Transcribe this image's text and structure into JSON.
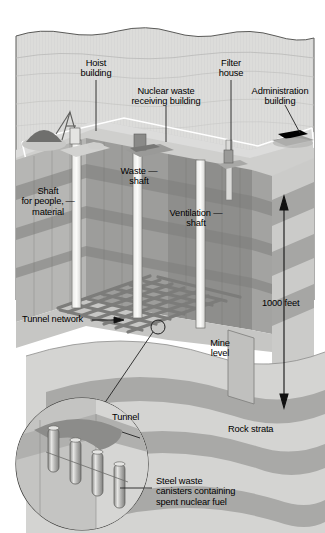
{
  "figure": {
    "title_implied": "Cross-section of an underground nuclear waste repository",
    "type": "cutaway-isometric-diagram"
  },
  "labels": {
    "hoist_building": "Hoist\nbuilding",
    "nuclear_waste_receiving_building": "Nuclear waste\nreceiving building",
    "filter_house": "Filter\nhouse",
    "administration_building": "Administration\nbuilding",
    "shaft_for_people": "Shaft\nfor people, —\nmaterial",
    "waste_shaft": "Waste —\nshaft",
    "ventilation_shaft": "Ventilation —\nshaft",
    "tunnel_network": "Tunnel network",
    "depth_measure": "1000 feet",
    "mine_level": "Mine\nlevel",
    "rock_strata": "Rock strata",
    "tunnel": "Tunnel",
    "canisters": "Steel waste\ncanisters containing\nspent nuclear fuel"
  },
  "colors": {
    "sky": "#ffffff",
    "ground_light": "#d8d8d6",
    "ground_mid": "#c2c2c0",
    "strata_light": "#d2d2d0",
    "strata_dark": "#a9a9a7",
    "strata_darker": "#949492",
    "shaft_wall_dark": "#8e8e8c",
    "shaft_wall_mid": "#a4a4a2",
    "shaft_white": "#f2f2f0",
    "tunnel_dark": "#7e7e7c",
    "canister": "#bdbdbb",
    "outline": "#3a3a3a",
    "label_text": "#000000",
    "fence_line": "#ffffff"
  },
  "annotations": {
    "depth_arrow": "double-headed vertical arrow spanning surface to mine level",
    "tunnel_network_arrow": "horizontal leader arrow pointing right",
    "inset": "magnified circular callout of a tunnel with canisters"
  }
}
